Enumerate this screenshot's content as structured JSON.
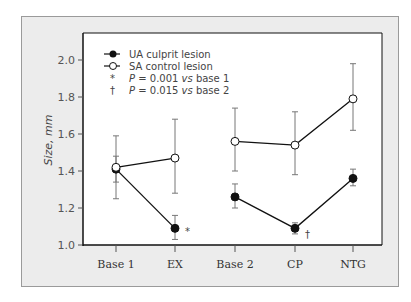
{
  "chart_data": {
    "type": "line",
    "title": "",
    "xlabel": "",
    "ylabel": "Size, mm",
    "ylim": [
      1.0,
      2.1
    ],
    "yticks": [
      "1.0",
      "1.2",
      "1.4",
      "1.6",
      "1.8",
      "2.0"
    ],
    "categories": [
      "Base 1",
      "EX",
      "Base 2",
      "CP",
      "NTG"
    ],
    "segments": [
      [
        "Base 1",
        "EX"
      ],
      [
        "Base 2",
        "CP",
        "NTG"
      ]
    ],
    "series": [
      {
        "name": "UA culprit lesion",
        "marker": "filled-circle",
        "values": [
          1.41,
          1.09,
          1.26,
          1.09,
          1.36
        ],
        "error_low": [
          1.34,
          1.03,
          1.2,
          1.06,
          1.32
        ],
        "error_high": [
          1.48,
          1.16,
          1.33,
          1.12,
          1.41
        ]
      },
      {
        "name": "SA control lesion",
        "marker": "open-circle",
        "values": [
          1.42,
          1.47,
          1.56,
          1.54,
          1.79
        ],
        "error_low": [
          1.25,
          1.28,
          1.4,
          1.38,
          1.62
        ],
        "error_high": [
          1.59,
          1.68,
          1.74,
          1.72,
          1.98
        ]
      }
    ],
    "annotations": [
      {
        "symbol": "*",
        "category": "EX",
        "series": "UA culprit lesion",
        "text": "P = 0.001 vs base 1"
      },
      {
        "symbol": "†",
        "category": "CP",
        "series": "UA culprit lesion",
        "text": "P = 0.015 vs base 2"
      }
    ],
    "legend": {
      "position": "upper-left",
      "entries": [
        "UA culprit lesion",
        "SA control lesion",
        "P = 0.001 vs base 1",
        "P = 0.015 vs base 2"
      ]
    },
    "grid": false
  },
  "legend": {
    "ua": "UA culprit lesion",
    "sa": "SA control lesion",
    "star_symbol": "*",
    "star_p": "P",
    "star_text": " = 0.001 ",
    "star_vs": "vs",
    "star_tail": " base 1",
    "dagger_symbol": "†",
    "dagger_p": "P",
    "dagger_text": " = 0.015 ",
    "dagger_vs": "vs",
    "dagger_tail": " base 2"
  },
  "axis": {
    "ylabel_main": "Size, ",
    "ylabel_unit": "mm"
  },
  "colors": {
    "panel_bg": "#ececec",
    "plot_bg": "#ffffff",
    "line": "#111111",
    "error_bar": "#888888"
  }
}
